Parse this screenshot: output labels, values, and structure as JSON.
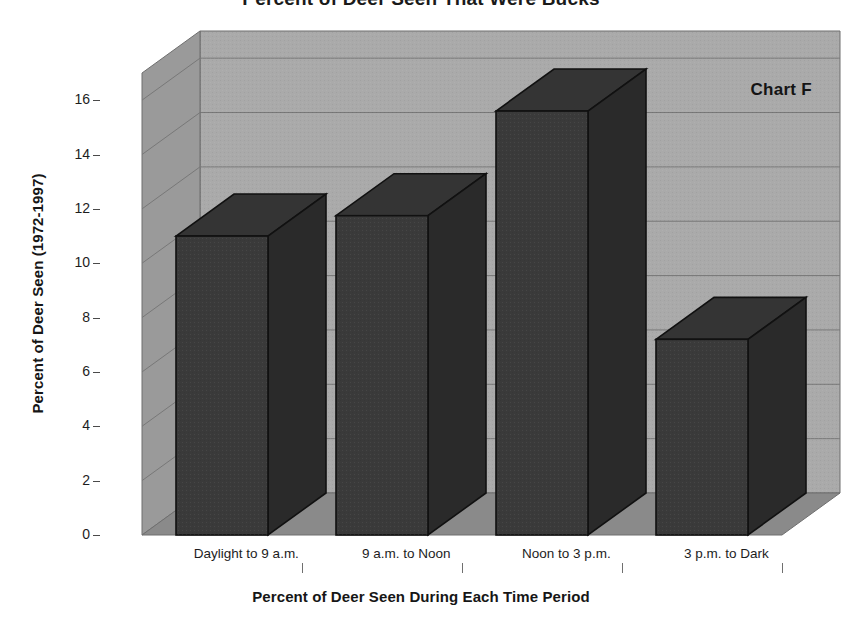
{
  "chart_data": {
    "type": "bar",
    "title": "Percent of Deer Seen That Were Bucks",
    "annotation": "Chart F",
    "xlabel": "Percent of Deer Seen During Each Time Period",
    "ylabel": "Percent of Deer Seen (1972-1997)",
    "categories": [
      "Daylight to 9 a.m.",
      "9 a.m. to Noon",
      "Noon to 3 p.m.",
      "3 p.m. to Dark"
    ],
    "values": [
      11.0,
      11.75,
      15.6,
      7.2
    ],
    "ylim": [
      0,
      17
    ],
    "yticks": [
      0,
      2,
      4,
      6,
      8,
      10,
      12,
      14,
      16
    ],
    "ytick_labels": [
      "0",
      "2",
      "4",
      "6",
      "8",
      "10",
      "12",
      "14",
      "16"
    ],
    "grid": true,
    "legend": "none",
    "style": "3d-column",
    "colors": {
      "bar_front": "#3a3a3a",
      "bar_side": "#2a2a2a",
      "bar_top": "#343434",
      "bar_outline": "#111111",
      "back_wall": "#aaaaaa",
      "side_wall": "#9a9a9a",
      "floor": "#8a8a8a",
      "gridline": "#787878",
      "text": "#161616",
      "page_background": "#ffffff"
    }
  }
}
